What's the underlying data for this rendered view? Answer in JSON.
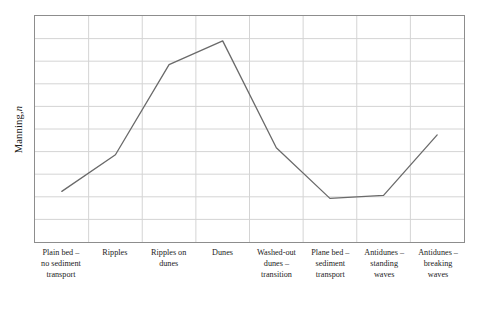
{
  "chart_data": {
    "type": "line",
    "title": "",
    "subtitle": "",
    "xlabel": "",
    "ylabel": "Manning, n",
    "ylabel_plain": "Manning,",
    "ylabel_italic": "n",
    "categories": [
      "Plain bed – no sediment transport",
      "Ripples",
      "Ripples on dunes",
      "Dunes",
      "Washed-out dunes – transition",
      "Plane bed – sediment transport",
      "Antidunes – standing waves",
      "Antidunes – breaking waves"
    ],
    "category_lines": [
      [
        "Plain bed –",
        "no sediment",
        "transport"
      ],
      [
        "Ripples"
      ],
      [
        "Ripples on",
        "dunes"
      ],
      [
        "Dunes"
      ],
      [
        "Washed-out",
        "dunes –",
        "transition"
      ],
      [
        "Plane bed –",
        "sediment",
        "transport"
      ],
      [
        "Antidunes –",
        "standing",
        "waves"
      ],
      [
        "Antidunes –",
        "breaking",
        "waves"
      ]
    ],
    "values": [
      0.224,
      0.386,
      0.785,
      0.89,
      0.417,
      0.193,
      0.206,
      0.474
    ],
    "ylim": [
      0,
      1
    ],
    "yticks": [
      0.1,
      0.2,
      0.3,
      0.4,
      0.5,
      0.6,
      0.7,
      0.8,
      0.9
    ],
    "ytick_labels": [],
    "grid": true,
    "grid_horizontal_lines": 9,
    "grid_vertical_lines": 7,
    "legend": false,
    "legend_position": "none",
    "series": [
      {
        "name": "Manning, n",
        "values": [
          0.224,
          0.386,
          0.785,
          0.89,
          0.417,
          0.193,
          0.206,
          0.474
        ]
      }
    ],
    "annotations": []
  },
  "style": {
    "line_color": "#6a6a6a",
    "line_width": 1.3,
    "grid_color": "#d4d4d4",
    "frame_color": "#8d8d8d",
    "background": "#ffffff",
    "text_color": "#1c1c1c"
  }
}
